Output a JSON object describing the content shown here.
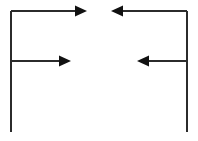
{
  "canvas": {
    "width": 198,
    "height": 141,
    "background": "#ffffff"
  },
  "style": {
    "stroke_color": "#2b2b2b",
    "stroke_width": 2,
    "arrowhead_fill": "#111111",
    "arrowhead_length": 12,
    "arrowhead_width": 11
  },
  "diagram": {
    "shapes": [
      {
        "id": "left-bracket",
        "name": "left-bracket-stem",
        "type": "polyline",
        "points": "11,11 11,132",
        "label": "Left vertical stem"
      },
      {
        "id": "right-bracket",
        "name": "right-bracket-stem",
        "type": "polyline",
        "points": "187,11 187,132",
        "label": "Right vertical stem"
      }
    ],
    "arrows": [
      {
        "id": "arrow-top-left",
        "name": "top-left-arrow",
        "direction": "right",
        "from": {
          "x": 11,
          "y": 11
        },
        "to": {
          "x": 87,
          "y": 11
        },
        "label": "Top left rightward arrow"
      },
      {
        "id": "arrow-mid-left",
        "name": "middle-left-arrow",
        "direction": "right",
        "from": {
          "x": 11,
          "y": 61
        },
        "to": {
          "x": 71,
          "y": 61
        },
        "label": "Middle left rightward arrow"
      },
      {
        "id": "arrow-top-right",
        "name": "top-right-arrow",
        "direction": "left",
        "from": {
          "x": 187,
          "y": 11
        },
        "to": {
          "x": 111,
          "y": 11
        },
        "label": "Top right leftward arrow"
      },
      {
        "id": "arrow-mid-right",
        "name": "middle-right-arrow",
        "direction": "left",
        "from": {
          "x": 187,
          "y": 61
        },
        "to": {
          "x": 137,
          "y": 61
        },
        "label": "Middle right leftward arrow"
      }
    ]
  }
}
